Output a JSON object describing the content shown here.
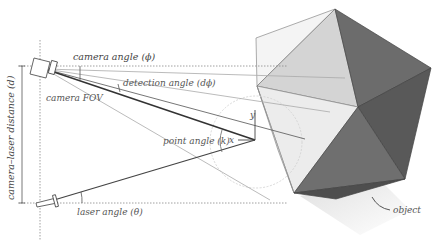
{
  "diagram": {
    "labels": {
      "camera_angle": "camera angle (ϕ)",
      "detection_angle": "detection angle (dϕ)",
      "camera_fov": "camera FOV",
      "camera_laser_distance": "camera–laser distance (d)",
      "point_angle": "point angle (k)",
      "laser_angle": "laser angle (θ)",
      "x_axis": "x",
      "y_axis": "y",
      "object": "object"
    },
    "colors": {
      "background": "#ffffff",
      "line": "#555555",
      "beam": "#333333",
      "guide": "#999999",
      "face_light": "#e6e6e6",
      "face_mid": "#d2d2d2",
      "face_dark": "#6e6e6e",
      "face_darker": "#5a5a5a",
      "shadow": "#e0e0e0"
    }
  }
}
